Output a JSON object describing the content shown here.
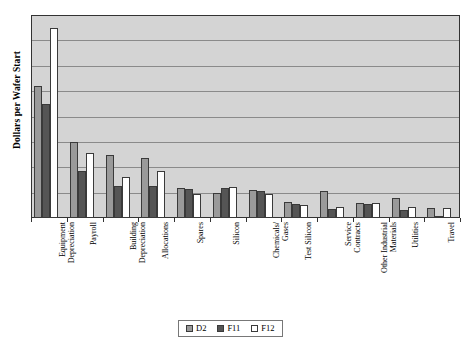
{
  "chart_data": {
    "type": "bar",
    "title": "",
    "xlabel": "",
    "ylabel": "Dollars per Wafer Start",
    "ylim": [
      0,
      8
    ],
    "grid": true,
    "gridline_count": 8,
    "y_tick_labels": [],
    "legend_position": "bottom-center",
    "categories": [
      "Equipment\nDepreciation",
      "Payroll",
      "Building\nDepreciation",
      "Allocations",
      "Spares",
      "Silicon",
      "Chemicals/\nGases",
      "Test Silicon",
      "Service\nContracts",
      "Other Industrial\nMaterials",
      "Utilities",
      "Travel"
    ],
    "series": [
      {
        "name": "D2",
        "color": "#9a9a9a",
        "values": [
          5.2,
          3.0,
          2.5,
          2.35,
          1.2,
          1.0,
          1.12,
          0.62,
          1.05,
          0.6,
          0.78,
          0.4
        ]
      },
      {
        "name": "F11",
        "color": "#555555",
        "values": [
          4.5,
          1.85,
          1.25,
          1.25,
          1.15,
          1.2,
          1.05,
          0.55,
          0.35,
          0.55,
          0.3,
          0.07
        ]
      },
      {
        "name": "F12",
        "color": "#ffffff",
        "values": [
          7.5,
          2.55,
          1.6,
          1.85,
          0.95,
          1.22,
          0.95,
          0.5,
          0.45,
          0.58,
          0.45,
          0.4
        ]
      }
    ]
  },
  "axis": {
    "y_title": "Dollars per Wafer Start"
  },
  "legend": {
    "items": [
      {
        "label": "D2",
        "color": "#9a9a9a"
      },
      {
        "label": "F11",
        "color": "#555555"
      },
      {
        "label": "F12",
        "color": "#ffffff"
      }
    ]
  },
  "style": {
    "plot_background": "#d4d4d4",
    "gridline_color": "#8a8a8a",
    "frame_color": "#333333",
    "page_background": "#ffffff"
  }
}
